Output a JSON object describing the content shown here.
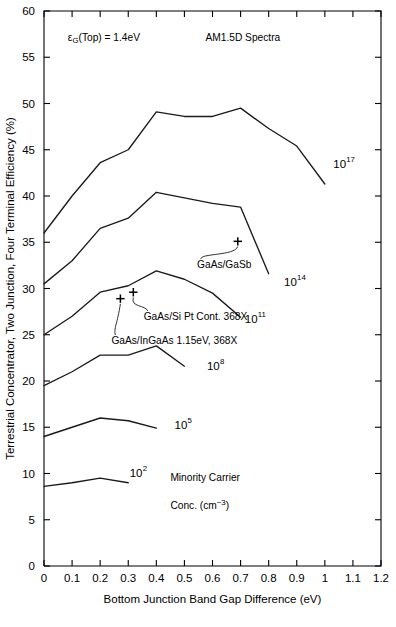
{
  "chart_data": {
    "type": "line",
    "title": "",
    "xlabel": "Bottom Junction Band Gap Difference (eV)",
    "ylabel": "Terrestrial Concentrator, Two Junction, Four Terminal Efficiency (%)",
    "xlim": [
      0,
      1.2
    ],
    "ylim": [
      0,
      60
    ],
    "xticks": [
      "0",
      "0.1",
      "0.2",
      "0.3",
      "0.4",
      "0.5",
      "0.6",
      "0.7",
      "0.8",
      "0.9",
      "1",
      "1.1",
      "1.2"
    ],
    "xtick_values": [
      0,
      0.1,
      0.2,
      0.3,
      0.4,
      0.5,
      0.6,
      0.7,
      0.8,
      0.9,
      1.0,
      1.1,
      1.2
    ],
    "yticks": [
      "0",
      "5",
      "10",
      "15",
      "20",
      "25",
      "30",
      "35",
      "40",
      "45",
      "50",
      "55",
      "60"
    ],
    "ytick_values": [
      0,
      5,
      10,
      15,
      20,
      25,
      30,
      35,
      40,
      45,
      50,
      55,
      60
    ],
    "grid": false,
    "legend_position": "inline-end-of-curve",
    "series": [
      {
        "name": "10^17",
        "label_base": "10",
        "label_exp": "17",
        "label_x": 1.03,
        "label_y": 43.0,
        "x": [
          0.0,
          0.1,
          0.2,
          0.3,
          0.4,
          0.5,
          0.6,
          0.7,
          0.8,
          0.9,
          1.0
        ],
        "y": [
          36.0,
          40.0,
          43.6,
          45.0,
          49.1,
          48.6,
          48.6,
          49.5,
          47.3,
          45.4,
          41.3
        ]
      },
      {
        "name": "10^14",
        "label_base": "10",
        "label_exp": "14",
        "label_x": 0.855,
        "label_y": 30.3,
        "x": [
          0.0,
          0.1,
          0.2,
          0.3,
          0.4,
          0.5,
          0.6,
          0.7,
          0.8
        ],
        "y": [
          30.5,
          33.0,
          36.5,
          37.6,
          40.4,
          39.8,
          39.2,
          38.8,
          31.6
        ]
      },
      {
        "name": "10^11",
        "label_base": "10",
        "label_exp": "11",
        "label_x": 0.715,
        "label_y": 26.3,
        "x": [
          0.0,
          0.1,
          0.2,
          0.3,
          0.4,
          0.5,
          0.6,
          0.7
        ],
        "y": [
          25.0,
          27.0,
          29.6,
          30.3,
          31.9,
          31.0,
          29.5,
          26.9
        ]
      },
      {
        "name": "10^8",
        "label_base": "10",
        "label_exp": "8",
        "label_x": 0.58,
        "label_y": 21.2,
        "x": [
          0.0,
          0.1,
          0.2,
          0.3,
          0.4,
          0.5
        ],
        "y": [
          19.5,
          21.0,
          22.8,
          22.8,
          23.8,
          21.6
        ]
      },
      {
        "name": "10^5",
        "label_base": "10",
        "label_exp": "5",
        "label_x": 0.465,
        "label_y": 14.8,
        "x": [
          0.0,
          0.1,
          0.2,
          0.3,
          0.4
        ],
        "y": [
          14.0,
          15.0,
          16.0,
          15.7,
          14.9
        ]
      },
      {
        "name": "10^2",
        "label_base": "10",
        "label_exp": "2",
        "label_x": 0.305,
        "label_y": 9.6,
        "x": [
          0.0,
          0.1,
          0.2,
          0.3
        ],
        "y": [
          8.6,
          9.0,
          9.5,
          9.0
        ]
      }
    ],
    "markers": [
      {
        "label": "GaAs/GaSb",
        "x": 0.69,
        "y": 35.1,
        "label_x": 0.545,
        "label_y": 32.2
      },
      {
        "label": "GaAs/Si Pt Cont. 368X",
        "x": 0.318,
        "y": 29.6,
        "label_x": 0.355,
        "label_y": 26.6
      },
      {
        "label": "GaAs/InGaAs 1.15eV, 368X",
        "x": 0.272,
        "y": 28.9,
        "label_x": 0.24,
        "label_y": 24.0
      }
    ],
    "annotations": [
      {
        "name": "top-bandgap-note",
        "text_pre": "ε",
        "text_sub": "G",
        "text_post": "(Top) = 1.4eV",
        "x": 0.085,
        "y": 56.8
      },
      {
        "name": "spectrum-note",
        "text": "AM1.5D Spectra",
        "x": 0.575,
        "y": 56.8
      },
      {
        "name": "minority-carrier-note-line1",
        "text": "Minority Carrier",
        "x": 0.45,
        "y": 9.2
      },
      {
        "name": "minority-carrier-note-line2",
        "text_pre": "Conc.  (cm",
        "text_sup": "−3",
        "text_post": ")",
        "x": 0.45,
        "y": 6.2
      }
    ]
  }
}
